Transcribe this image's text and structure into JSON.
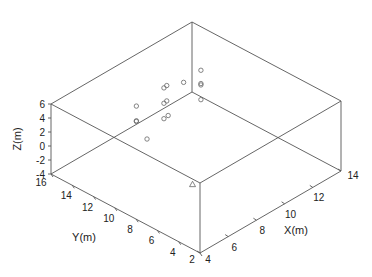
{
  "chart_data": {
    "type": "scatter",
    "title": "",
    "xlabel": "X(m)",
    "ylabel": "Y(m)",
    "zlabel": "Z(m)",
    "xlim": [
      4,
      14
    ],
    "ylim": [
      2,
      16
    ],
    "zlim": [
      -4,
      6
    ],
    "xticks": [
      4,
      6,
      8,
      10,
      12,
      14
    ],
    "yticks": [
      2,
      4,
      6,
      8,
      10,
      12,
      14,
      16
    ],
    "zticks": [
      -4,
      -2,
      0,
      2,
      4,
      6
    ],
    "grid": false,
    "legend": null,
    "series": [
      {
        "name": "circles",
        "marker": "circle",
        "points": [
          {
            "x": 9.3,
            "y": 15.0,
            "z": 0.3
          },
          {
            "x": 9.3,
            "y": 15.0,
            "z": -1.8
          },
          {
            "x": 9.3,
            "y": 15.0,
            "z": -1.9
          },
          {
            "x": 9.3,
            "y": 14.0,
            "z": -3.6
          },
          {
            "x": 10.5,
            "y": 14.0,
            "z": 2.3
          },
          {
            "x": 10.7,
            "y": 14.0,
            "z": 2.4
          },
          {
            "x": 10.5,
            "y": 14.0,
            "z": 0.1
          },
          {
            "x": 10.7,
            "y": 14.0,
            "z": 0.2
          },
          {
            "x": 10.5,
            "y": 14.0,
            "z": -2.1
          },
          {
            "x": 10.8,
            "y": 14.0,
            "z": -2.0
          },
          {
            "x": 12.5,
            "y": 14.8,
            "z": 0.1
          },
          {
            "x": 13.5,
            "y": 14.5,
            "z": 0.9
          },
          {
            "x": 13.5,
            "y": 14.5,
            "z": -1.0
          },
          {
            "x": 13.5,
            "y": 14.5,
            "z": -1.2
          },
          {
            "x": 13.5,
            "y": 14.5,
            "z": -3.3
          }
        ]
      },
      {
        "name": "triangle",
        "marker": "triangle",
        "points": [
          {
            "x": 8.0,
            "y": 8.0,
            "z": -3.7
          }
        ]
      }
    ]
  }
}
